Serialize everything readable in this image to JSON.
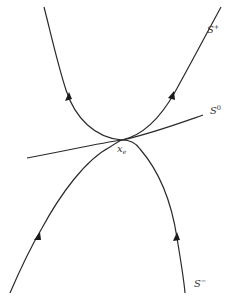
{
  "diagram": {
    "type": "phase-portrait",
    "labels": {
      "s_plus": {
        "base": "S",
        "sup": "+"
      },
      "s_zero": {
        "base": "S",
        "sup": "0"
      },
      "s_minus": {
        "base": "S",
        "sup": "−"
      },
      "equilibrium": {
        "base": "x",
        "sub": "e"
      }
    },
    "curves": [
      {
        "name": "upper-left-orbit",
        "direction": "away-from-equilibrium"
      },
      {
        "name": "unstable-manifold-S-plus",
        "direction": "away-from-equilibrium"
      },
      {
        "name": "center-manifold-S0",
        "direction": "none"
      },
      {
        "name": "lower-left-orbit",
        "direction": "toward-equilibrium"
      },
      {
        "name": "stable-manifold-S-minus",
        "direction": "toward-equilibrium"
      }
    ],
    "colors": {
      "stroke": "#2a2a2a",
      "background": "#ffffff"
    }
  }
}
